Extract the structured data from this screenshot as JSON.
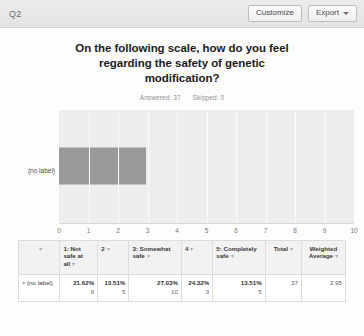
{
  "topbar": {
    "question_label": "Q2",
    "customize_label": "Customize",
    "export_label": "Export",
    "export_caret": "caret-down-icon"
  },
  "chart_header": {
    "title": "On the following scale, how do you feel regarding the safety of genetic modification?",
    "title_line1": "On the following scale, how do you feel",
    "title_line2": "regarding the safety of genetic",
    "title_line3": "modification?",
    "answered_label": "Answered: 37",
    "skipped_label": "Skipped: 0"
  },
  "chart_data": {
    "type": "bar",
    "orientation": "horizontal",
    "title": "On the following scale, how do you feel regarding the safety of genetic modification?",
    "categories": [
      "(no label)"
    ],
    "values": [
      2.95
    ],
    "series": [
      {
        "name": "Weighted Average",
        "values": [
          2.95
        ]
      }
    ],
    "xlabel": "",
    "ylabel": "",
    "xlim": [
      0,
      10
    ],
    "xticks": [
      0,
      1,
      2,
      3,
      4,
      5,
      6,
      7,
      8,
      9,
      10
    ],
    "grid": true,
    "legend": false,
    "bar_color": "#9a9a9a",
    "plot_background": "#ededed",
    "gridline_color": "#fbfbfb"
  },
  "table": {
    "headers": [
      {
        "label": "",
        "sort": ""
      },
      {
        "label": "",
        "sort": "▾"
      },
      {
        "label": "1: Not safe at all",
        "sort": "▾"
      },
      {
        "label": "2",
        "sort": "▾"
      },
      {
        "label": "3: Somewhat safe",
        "sort": "▾"
      },
      {
        "label": "4",
        "sort": "▾"
      },
      {
        "label": "5: Completely safe",
        "sort": "▾"
      },
      {
        "label": "Total",
        "sort": "▾"
      },
      {
        "label": "Weighted Average",
        "sort": "▾"
      }
    ],
    "header_blank": "",
    "header_sort_caret": "▾",
    "header_1": "1: Not safe at all",
    "header_2": "2",
    "header_3": "3: Somewhat safe",
    "header_4": "4",
    "header_5": "5: Completely safe",
    "header_total": "Total",
    "header_weighted": "Weighted Average",
    "rows": [
      {
        "expand_icon": "▾",
        "label": "(no label)",
        "cells": [
          {
            "pct": "21.62%",
            "count": "8"
          },
          {
            "pct": "13.51%",
            "count": "5"
          },
          {
            "pct": "27.03%",
            "count": "10"
          },
          {
            "pct": "24.32%",
            "count": "9"
          },
          {
            "pct": "13.51%",
            "count": "5"
          }
        ],
        "total": "37",
        "weighted_average": "2.95"
      }
    ]
  },
  "colors": {
    "bar": "#9a9a9a",
    "plot_bg": "#ededed",
    "topbar_bg": "#e8e8e8",
    "table_header_bg": "#f2f2f2",
    "border": "#dcdcdc"
  }
}
